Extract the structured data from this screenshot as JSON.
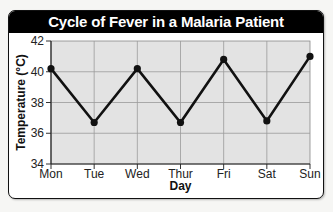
{
  "chart_data": {
    "type": "line",
    "title": "Cycle of Fever in a Malaria Patient",
    "xlabel": "Day",
    "ylabel": "Temperature (°C)",
    "categories": [
      "Mon",
      "Tue",
      "Wed",
      "Thur",
      "Fri",
      "Sat",
      "Sun"
    ],
    "series": [
      {
        "name": "Temperature",
        "values": [
          40.2,
          36.7,
          40.2,
          36.7,
          40.8,
          36.8,
          41.0
        ],
        "color": "#111111"
      }
    ],
    "ylim": [
      34,
      42
    ],
    "yticks": [
      34,
      36,
      38,
      40,
      42
    ],
    "grid": true,
    "legend": "none",
    "plot_background": "#e3e3e3",
    "grid_color": "#9a9a9a"
  }
}
